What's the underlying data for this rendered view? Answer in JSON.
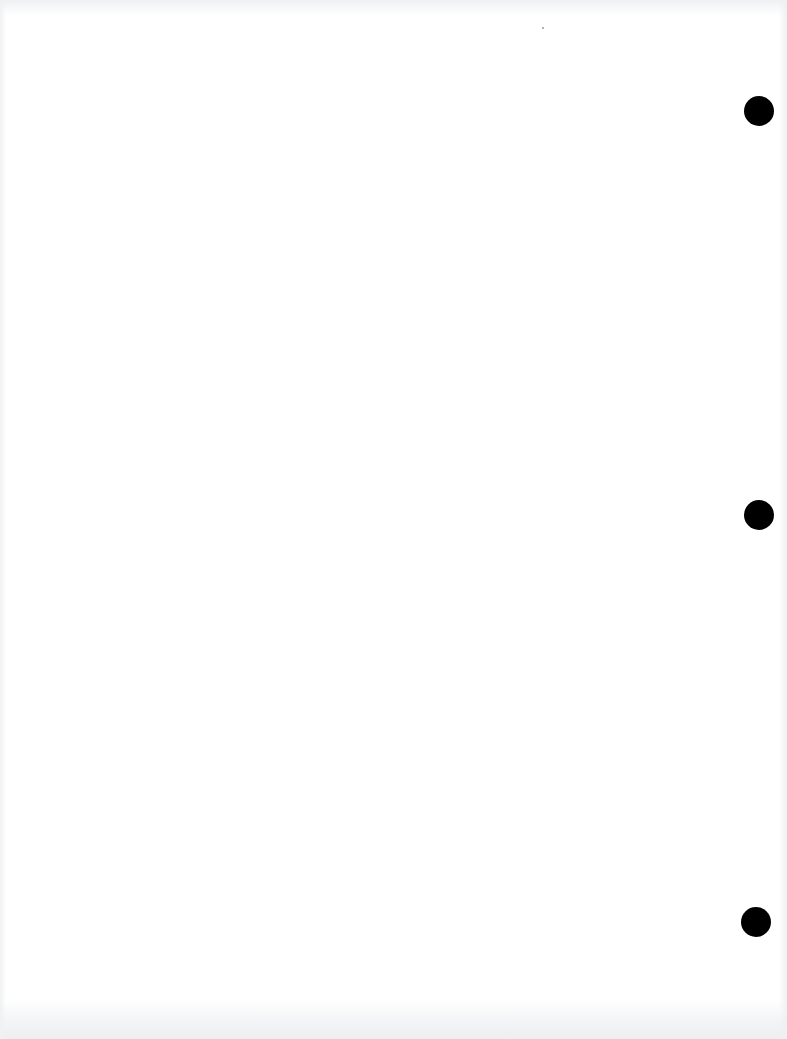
{
  "document": {
    "type": "blank scanned page",
    "text": "",
    "background_color": "#ffffff",
    "hole_punch_color": "#000000",
    "hole_punches": [
      {
        "cx": 759,
        "cy": 111,
        "d": 30
      },
      {
        "cx": 759,
        "cy": 515,
        "d": 30
      },
      {
        "cx": 756,
        "cy": 922,
        "d": 30
      }
    ]
  }
}
